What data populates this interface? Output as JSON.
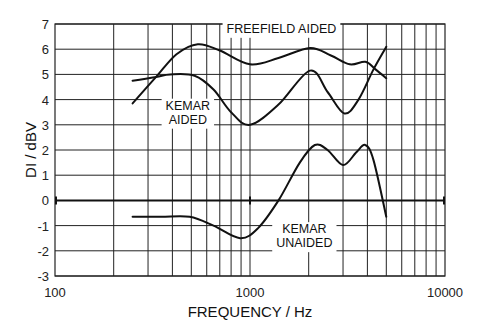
{
  "chart_data": {
    "type": "line",
    "title": "",
    "xlabel": "FREQUENCY / Hz",
    "ylabel": "DI / dBV",
    "xscale": "log",
    "xlim": [
      100,
      10000
    ],
    "ylim": [
      -3,
      7
    ],
    "x_ticks": [
      100,
      1000,
      10000
    ],
    "x_tick_labels": [
      "100",
      "1000",
      "10000"
    ],
    "y_ticks": [
      -3,
      -2,
      -1,
      0,
      1,
      2,
      3,
      4,
      5,
      6,
      7
    ],
    "y_tick_labels": [
      "-3",
      "-2",
      "-1",
      "0",
      "1",
      "2",
      "3",
      "4",
      "5",
      "6",
      "7"
    ],
    "grid": true,
    "legend": "none (inline annotations)",
    "series": [
      {
        "name": "FREEFIELD AIDED",
        "label_lines": [
          "FREEFIELD AIDED"
        ],
        "x": [
          250,
          330,
          420,
          540,
          700,
          1000,
          1400,
          2030,
          2600,
          3250,
          3900,
          4400,
          5000
        ],
        "y": [
          3.85,
          4.9,
          5.8,
          6.2,
          5.95,
          5.4,
          5.65,
          6.05,
          5.75,
          5.4,
          5.5,
          5.2,
          4.85
        ]
      },
      {
        "name": "KEMAR AIDED",
        "label_lines": [
          "KEMAR",
          "AIDED"
        ],
        "x": [
          250,
          330,
          390,
          520,
          650,
          800,
          1000,
          1400,
          2030,
          2500,
          3050,
          3600,
          4300,
          5000
        ],
        "y": [
          4.75,
          4.9,
          5.0,
          4.95,
          4.4,
          3.5,
          3.0,
          3.8,
          5.15,
          4.3,
          3.45,
          4.0,
          5.2,
          6.1
        ]
      },
      {
        "name": "KEMAR UNAIDED",
        "label_lines": [
          "KEMAR",
          "UNAIDED"
        ],
        "x": [
          250,
          350,
          490,
          650,
          890,
          1100,
          1400,
          1800,
          2150,
          2500,
          3000,
          3500,
          3900,
          4300,
          5000
        ],
        "y": [
          -0.65,
          -0.65,
          -0.65,
          -1.0,
          -1.5,
          -1.1,
          0.0,
          1.5,
          2.2,
          2.0,
          1.4,
          1.9,
          2.2,
          1.6,
          -0.65
        ]
      }
    ],
    "annotations": [
      {
        "text_lines": [
          "FREEFIELD AIDED"
        ],
        "freq": 1450,
        "value": 6.65
      },
      {
        "text_lines": [
          "KEMAR",
          "AIDED"
        ],
        "freq": 480,
        "value": 3.6
      },
      {
        "text_lines": [
          "KEMAR",
          "UNAIDED"
        ],
        "freq": 1900,
        "value": -1.3
      }
    ]
  }
}
